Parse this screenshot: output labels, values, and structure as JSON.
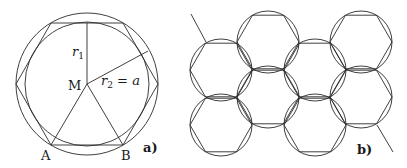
{
  "figure_a": {
    "label": "a)",
    "center_label": "M",
    "vertex_labels": {
      "left": "A",
      "right": "B"
    },
    "r1_label": "r",
    "r1_sub": "1",
    "r2_label": "r",
    "r2_sub": "2",
    "r2_eq": " = ",
    "r2_value": "a",
    "geometry": {
      "cx": 87,
      "cy": 84,
      "outer_radius": 71,
      "inner_radius": 62
    }
  },
  "figure_b": {
    "label": "b)",
    "hex_radius": 31,
    "hex_centers": [
      [
        221,
        70
      ],
      [
        221,
        125
      ],
      [
        268,
        42
      ],
      [
        268,
        97
      ],
      [
        315,
        70
      ],
      [
        315,
        125
      ],
      [
        361,
        42
      ],
      [
        361,
        97
      ]
    ]
  },
  "colors": {
    "line": "#2a2a2a",
    "background": "#ffffff"
  }
}
